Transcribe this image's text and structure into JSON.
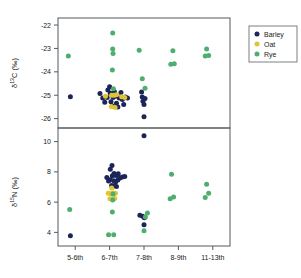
{
  "chart_data": {
    "type": "scatter",
    "title": "",
    "subtitle": "",
    "xlabel": "",
    "categories": [
      "5-6th",
      "6-7th",
      "7-8th",
      "8-9th",
      "11-13th"
    ],
    "grid": false,
    "legend": {
      "position": "right",
      "entries": [
        {
          "name": "Barley",
          "color": "#1b2559",
          "marker": "circle"
        },
        {
          "name": "Oat",
          "color": "#e0c533",
          "marker": "circle"
        },
        {
          "name": "Rye",
          "color": "#4eae6e",
          "marker": "circle"
        }
      ]
    },
    "panels": [
      {
        "id": "d13c",
        "ylabel": "δ¹³C (‰)",
        "ylabel_parts": {
          "delta": "δ",
          "sup": "13",
          "element": "C (‰)"
        },
        "ylim": [
          -26.4,
          -21.7
        ],
        "yticks": [
          -22,
          -23,
          -24,
          -25,
          -26
        ],
        "ytick_labels": [
          "-22",
          "-23",
          "-24",
          "-25",
          "-26"
        ],
        "series": [
          {
            "name": "Barley",
            "color": "#1b2559",
            "points": [
              {
                "category": "5-6th",
                "x": 0.86,
                "y": -25.07
              },
              {
                "category": "6-7th",
                "x": 1.72,
                "y": -24.93
              },
              {
                "category": "6-7th",
                "x": 1.8,
                "y": -25.12
              },
              {
                "category": "6-7th",
                "x": 1.86,
                "y": -25.3
              },
              {
                "category": "6-7th",
                "x": 1.93,
                "y": -25.1
              },
              {
                "category": "6-7th",
                "x": 1.95,
                "y": -24.78
              },
              {
                "category": "6-7th",
                "x": 2.0,
                "y": -24.64
              },
              {
                "category": "6-7th",
                "x": 2.02,
                "y": -24.92
              },
              {
                "category": "6-7th",
                "x": 2.04,
                "y": -25.28
              },
              {
                "category": "6-7th",
                "x": 2.08,
                "y": -25.46
              },
              {
                "category": "6-7th",
                "x": 2.1,
                "y": -25.1
              },
              {
                "category": "6-7th",
                "x": 2.14,
                "y": -24.85
              },
              {
                "category": "6-7th",
                "x": 2.18,
                "y": -25.04
              },
              {
                "category": "6-7th",
                "x": 2.2,
                "y": -25.34
              },
              {
                "category": "6-7th",
                "x": 2.24,
                "y": -25.5
              },
              {
                "category": "6-7th",
                "x": 2.28,
                "y": -25.12
              },
              {
                "category": "6-7th",
                "x": 2.33,
                "y": -24.88
              },
              {
                "category": "6-7th",
                "x": 2.37,
                "y": -25.18
              },
              {
                "category": "6-7th",
                "x": 2.41,
                "y": -25.4
              },
              {
                "category": "6-7th",
                "x": 2.46,
                "y": -25.08
              },
              {
                "category": "6-7th",
                "x": 2.52,
                "y": -25.12
              },
              {
                "category": "7-8th",
                "x": 2.93,
                "y": -24.86
              },
              {
                "category": "7-8th",
                "x": 2.95,
                "y": -25.08
              },
              {
                "category": "7-8th",
                "x": 2.97,
                "y": -25.26
              },
              {
                "category": "7-8th",
                "x": 3.0,
                "y": -25.4
              },
              {
                "category": "7-8th",
                "x": 3.03,
                "y": -25.14
              },
              {
                "category": "7-8th",
                "x": 3.0,
                "y": -25.92
              }
            ]
          },
          {
            "name": "Oat",
            "color": "#e0c533",
            "points": [
              {
                "category": "6-7th",
                "x": 1.88,
                "y": -25.04
              },
              {
                "category": "6-7th",
                "x": 2.06,
                "y": -25.0
              },
              {
                "category": "6-7th",
                "x": 2.13,
                "y": -25.0
              },
              {
                "category": "6-7th",
                "x": 2.2,
                "y": -24.98
              },
              {
                "category": "6-7th",
                "x": 2.05,
                "y": -25.48
              },
              {
                "category": "6-7th",
                "x": 2.16,
                "y": -25.52
              },
              {
                "category": "6-7th",
                "x": 2.35,
                "y": -25.06
              },
              {
                "category": "6-7th",
                "x": 2.44,
                "y": -25.1
              }
            ]
          },
          {
            "name": "Rye",
            "color": "#4eae6e",
            "points": [
              {
                "category": "5-6th",
                "x": 0.8,
                "y": -23.32
              },
              {
                "category": "6-7th",
                "x": 2.09,
                "y": -22.34
              },
              {
                "category": "6-7th",
                "x": 2.09,
                "y": -23.02
              },
              {
                "category": "6-7th",
                "x": 2.1,
                "y": -23.22
              },
              {
                "category": "6-7th",
                "x": 2.08,
                "y": -23.92
              },
              {
                "category": "6-7th",
                "x": 2.11,
                "y": -24.72
              },
              {
                "category": "7-8th",
                "x": 2.86,
                "y": -23.08
              },
              {
                "category": "7-8th",
                "x": 2.95,
                "y": -24.3
              },
              {
                "category": "7-8th",
                "x": 3.03,
                "y": -24.7
              },
              {
                "category": "8-9th",
                "x": 3.84,
                "y": -23.1
              },
              {
                "category": "8-9th",
                "x": 3.78,
                "y": -23.68
              },
              {
                "category": "8-9th",
                "x": 3.88,
                "y": -23.66
              },
              {
                "category": "11-13th",
                "x": 4.82,
                "y": -23.02
              },
              {
                "category": "11-13th",
                "x": 4.78,
                "y": -23.32
              },
              {
                "category": "11-13th",
                "x": 4.88,
                "y": -23.3
              }
            ]
          }
        ]
      },
      {
        "id": "d15n",
        "ylabel": "δ¹⁵N (‰)",
        "ylabel_parts": {
          "delta": "δ",
          "sup": "15",
          "element": "N (‰)"
        },
        "ylim": [
          3.1,
          10.9
        ],
        "yticks": [
          10,
          8,
          6,
          4
        ],
        "ytick_labels": [
          "10",
          "8",
          "6",
          "4"
        ],
        "series": [
          {
            "name": "Barley",
            "color": "#1b2559",
            "points": [
              {
                "category": "5-6th",
                "x": 0.86,
                "y": 3.78
              },
              {
                "category": "6-7th",
                "x": 2.07,
                "y": 8.42
              },
              {
                "category": "6-7th",
                "x": 2.02,
                "y": 8.18
              },
              {
                "category": "6-7th",
                "x": 1.92,
                "y": 7.62
              },
              {
                "category": "6-7th",
                "x": 1.97,
                "y": 7.4
              },
              {
                "category": "6-7th",
                "x": 2.02,
                "y": 7.48
              },
              {
                "category": "6-7th",
                "x": 2.08,
                "y": 7.74
              },
              {
                "category": "6-7th",
                "x": 2.13,
                "y": 7.9
              },
              {
                "category": "6-7th",
                "x": 2.19,
                "y": 7.76
              },
              {
                "category": "6-7th",
                "x": 2.25,
                "y": 7.88
              },
              {
                "category": "6-7th",
                "x": 2.12,
                "y": 7.42
              },
              {
                "category": "6-7th",
                "x": 2.18,
                "y": 7.34
              },
              {
                "category": "6-7th",
                "x": 2.24,
                "y": 7.46
              },
              {
                "category": "6-7th",
                "x": 2.3,
                "y": 7.6
              },
              {
                "category": "6-7th",
                "x": 2.37,
                "y": 7.66
              },
              {
                "category": "6-7th",
                "x": 2.44,
                "y": 7.7
              },
              {
                "category": "6-7th",
                "x": 2.06,
                "y": 7.1
              },
              {
                "category": "6-7th",
                "x": 2.13,
                "y": 7.08
              },
              {
                "category": "6-7th",
                "x": 2.2,
                "y": 7.04
              },
              {
                "category": "7-8th",
                "x": 2.88,
                "y": 5.14
              },
              {
                "category": "7-8th",
                "x": 2.96,
                "y": 5.06
              },
              {
                "category": "7-8th",
                "x": 3.01,
                "y": 4.96
              },
              {
                "category": "7-8th",
                "x": 3.0,
                "y": 4.5
              },
              {
                "category": "7-8th",
                "x": 3.0,
                "y": 10.38
              }
            ]
          },
          {
            "name": "Oat",
            "color": "#e0c533",
            "points": [
              {
                "category": "6-7th",
                "x": 2.06,
                "y": 6.94
              },
              {
                "category": "6-7th",
                "x": 1.96,
                "y": 6.58
              },
              {
                "category": "6-7th",
                "x": 2.03,
                "y": 6.56
              },
              {
                "category": "6-7th",
                "x": 2.1,
                "y": 6.6
              },
              {
                "category": "6-7th",
                "x": 2.17,
                "y": 6.58
              },
              {
                "category": "6-7th",
                "x": 2.01,
                "y": 6.22
              },
              {
                "category": "6-7th",
                "x": 2.08,
                "y": 6.2
              },
              {
                "category": "6-7th",
                "x": 2.15,
                "y": 6.24
              }
            ]
          },
          {
            "name": "Rye",
            "color": "#4eae6e",
            "points": [
              {
                "category": "5-6th",
                "x": 0.84,
                "y": 5.52
              },
              {
                "category": "6-7th",
                "x": 2.1,
                "y": 6.54
              },
              {
                "category": "6-7th",
                "x": 2.09,
                "y": 6.14
              },
              {
                "category": "6-7th",
                "x": 2.08,
                "y": 5.34
              },
              {
                "category": "6-7th",
                "x": 1.97,
                "y": 3.84
              },
              {
                "category": "6-7th",
                "x": 2.12,
                "y": 3.84
              },
              {
                "category": "7-8th",
                "x": 3.1,
                "y": 5.28
              },
              {
                "category": "7-8th",
                "x": 3.04,
                "y": 5.02
              },
              {
                "category": "7-8th",
                "x": 3.0,
                "y": 4.1
              },
              {
                "category": "8-9th",
                "x": 3.8,
                "y": 7.84
              },
              {
                "category": "8-9th",
                "x": 3.76,
                "y": 6.22
              },
              {
                "category": "8-9th",
                "x": 3.86,
                "y": 6.34
              },
              {
                "category": "11-13th",
                "x": 4.82,
                "y": 7.18
              },
              {
                "category": "11-13th",
                "x": 4.78,
                "y": 6.3
              },
              {
                "category": "11-13th",
                "x": 4.88,
                "y": 6.58
              }
            ]
          }
        ]
      }
    ]
  }
}
